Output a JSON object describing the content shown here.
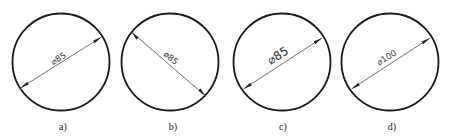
{
  "diagram": {
    "colors": {
      "outline": "#1a1a1a",
      "dimension": "#333333",
      "background": "#ffffff"
    },
    "figures": [
      {
        "id": "a",
        "label": "a)",
        "dimension_text": "⌀85",
        "diameter_value": 85,
        "line_direction": "lower-left to upper-right",
        "text_size": "small",
        "text_position": "above line"
      },
      {
        "id": "b",
        "label": "b)",
        "dimension_text": "⌀85",
        "diameter_value": 85,
        "line_direction": "upper-left to lower-right",
        "text_size": "small",
        "text_position": "on line"
      },
      {
        "id": "c",
        "label": "c)",
        "dimension_text": "⌀85",
        "diameter_value": 85,
        "line_direction": "lower-left to upper-right",
        "text_size": "large",
        "text_position": "above line"
      },
      {
        "id": "d",
        "label": "d)",
        "dimension_text": "⌀100",
        "diameter_value": 100,
        "line_direction": "lower-left to upper-right",
        "text_size": "small",
        "text_position": "above line"
      }
    ]
  }
}
